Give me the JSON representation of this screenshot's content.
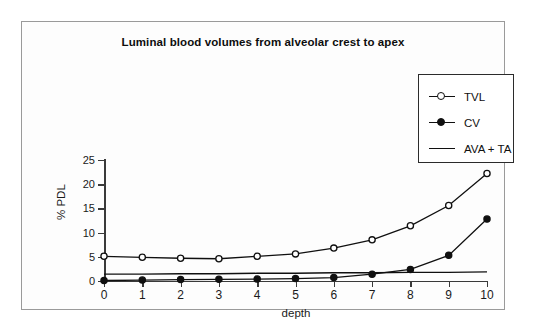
{
  "figure": {
    "title": "Luminal blood volumes from alveolar crest to apex",
    "frame_color": "#9a9a9a",
    "background": "#fdfdfd"
  },
  "axes": {
    "x_title": "depth",
    "y_title": "% PDL",
    "x_ticks": [
      "0",
      "1",
      "2",
      "3",
      "4",
      "5",
      "6",
      "7",
      "8",
      "9",
      "10"
    ],
    "y_ticks": [
      "0",
      "5",
      "10",
      "15",
      "20",
      "25"
    ],
    "axis_color": "#3a3a3a"
  },
  "legend": {
    "position": "top-right",
    "entries": [
      {
        "label": "TVL",
        "marker": "open-circle",
        "color": "#101010"
      },
      {
        "label": "CV",
        "marker": "filled-circle",
        "color": "#101010"
      },
      {
        "label": "AVA + TA",
        "marker": "line",
        "color": "#101010"
      }
    ]
  },
  "chart_data": {
    "type": "line",
    "title": "Luminal blood volumes from alveolar crest to apex",
    "xlabel": "depth",
    "ylabel": "% PDL",
    "xlim": [
      0,
      10
    ],
    "ylim": [
      0,
      25
    ],
    "grid": false,
    "legend_position": "top-right",
    "x": [
      0,
      1,
      2,
      3,
      4,
      5,
      6,
      7,
      8,
      9,
      10
    ],
    "series": [
      {
        "name": "TVL",
        "marker": "open-circle",
        "color": "#101010",
        "values": [
          5.1,
          4.9,
          4.7,
          4.6,
          5.1,
          5.6,
          6.8,
          8.5,
          11.4,
          15.6,
          22.2
        ]
      },
      {
        "name": "CV",
        "marker": "filled-circle",
        "color": "#101010",
        "values": [
          0.1,
          0.2,
          0.3,
          0.35,
          0.4,
          0.5,
          0.7,
          1.4,
          2.4,
          5.3,
          12.8
        ]
      },
      {
        "name": "AVA + TA",
        "marker": "none",
        "color": "#101010",
        "values": [
          1.4,
          1.4,
          1.5,
          1.5,
          1.6,
          1.6,
          1.7,
          1.7,
          1.8,
          1.8,
          1.9
        ]
      }
    ]
  }
}
